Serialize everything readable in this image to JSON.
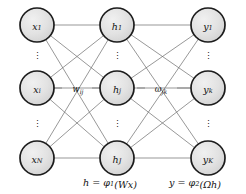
{
  "figure": {
    "type": "neural-network-diagram",
    "background_color": "#ffffff",
    "node_fill_color": "#dedede",
    "node_stroke_color": "#1c1c1c",
    "edge_color": "#6b6b6b"
  },
  "layers": [
    {
      "name": "input-layer",
      "center_x": 37,
      "nodes": [
        {
          "id": "x1",
          "base": "x",
          "sub": "1",
          "cx": 37,
          "cy": 25,
          "r": 17
        },
        {
          "id": "xi",
          "base": "x",
          "sub": "i",
          "cx": 37,
          "cy": 88,
          "r": 17
        },
        {
          "id": "xN",
          "base": "x",
          "sub": "N",
          "cx": 37,
          "cy": 158,
          "r": 17
        }
      ],
      "ellipses": [
        {
          "x": 37,
          "y": 56,
          "glyph": "⋮"
        },
        {
          "x": 37,
          "y": 124,
          "glyph": "⋮"
        }
      ]
    },
    {
      "name": "hidden-layer",
      "center_x": 117,
      "nodes": [
        {
          "id": "h1",
          "base": "h",
          "sub": "1",
          "cx": 117,
          "cy": 25,
          "r": 17
        },
        {
          "id": "hj",
          "base": "h",
          "sub": "j",
          "cx": 117,
          "cy": 88,
          "r": 17
        },
        {
          "id": "hJ",
          "base": "h",
          "sub": "J",
          "cx": 117,
          "cy": 158,
          "r": 17
        }
      ],
      "ellipses": [
        {
          "x": 117,
          "y": 56,
          "glyph": "⋮"
        },
        {
          "x": 117,
          "y": 124,
          "glyph": "⋮"
        }
      ]
    },
    {
      "name": "output-layer",
      "center_x": 208,
      "nodes": [
        {
          "id": "y1",
          "base": "y",
          "sub": "1",
          "cx": 208,
          "cy": 25,
          "r": 17
        },
        {
          "id": "yk",
          "base": "y",
          "sub": "k",
          "cx": 208,
          "cy": 88,
          "r": 17
        },
        {
          "id": "yK",
          "base": "y",
          "sub": "K",
          "cx": 208,
          "cy": 158,
          "r": 17
        }
      ],
      "ellipses": [
        {
          "x": 208,
          "y": 56,
          "glyph": "⋮"
        },
        {
          "x": 208,
          "y": 124,
          "glyph": "⋮"
        }
      ]
    }
  ],
  "weight_labels": [
    {
      "id": "w-ij",
      "base": "w",
      "sub": "ij",
      "x": 78,
      "y": 88,
      "dash_left": {
        "x1": 54,
        "x2": 62,
        "y": 88
      },
      "dash_right": {
        "x1": 92,
        "x2": 100,
        "y": 88
      }
    },
    {
      "id": "omega-jk",
      "base": "ω",
      "sub": "jk",
      "x": 161,
      "y": 88,
      "dash_left": {
        "x1": 137,
        "x2": 145,
        "y": 88
      },
      "dash_right": {
        "x1": 177,
        "x2": 191,
        "y": 88
      }
    }
  ],
  "equations": [
    {
      "id": "hidden-activation",
      "x": 110,
      "y": 182,
      "parts": [
        {
          "text": "h = φ",
          "style": "italic"
        },
        {
          "text": "1",
          "style": "sub"
        },
        {
          "text": "(Wx)",
          "style": "italic"
        }
      ],
      "plain": "h = φ1(Wx)"
    },
    {
      "id": "output-activation",
      "x": 195,
      "y": 182,
      "parts": [
        {
          "text": "y = φ",
          "style": "italic"
        },
        {
          "text": "2",
          "style": "sub"
        },
        {
          "text": "(Ωh)",
          "style": "italic"
        }
      ],
      "plain": "y = φ2(Ωh)"
    }
  ],
  "connections": {
    "input_to_hidden": "fully-connected",
    "hidden_to_output": "fully-connected",
    "input_to_hidden_pairs": [
      [
        "x1",
        "h1"
      ],
      [
        "x1",
        "hj"
      ],
      [
        "x1",
        "hJ"
      ],
      [
        "xi",
        "h1"
      ],
      [
        "xi",
        "hj"
      ],
      [
        "xi",
        "hJ"
      ],
      [
        "xN",
        "h1"
      ],
      [
        "xN",
        "hj"
      ],
      [
        "xN",
        "hJ"
      ]
    ],
    "hidden_to_output_pairs": [
      [
        "h1",
        "y1"
      ],
      [
        "h1",
        "yk"
      ],
      [
        "h1",
        "yK"
      ],
      [
        "hj",
        "y1"
      ],
      [
        "hj",
        "yk"
      ],
      [
        "hj",
        "yK"
      ],
      [
        "hJ",
        "y1"
      ],
      [
        "hJ",
        "yk"
      ],
      [
        "hJ",
        "yK"
      ]
    ]
  }
}
